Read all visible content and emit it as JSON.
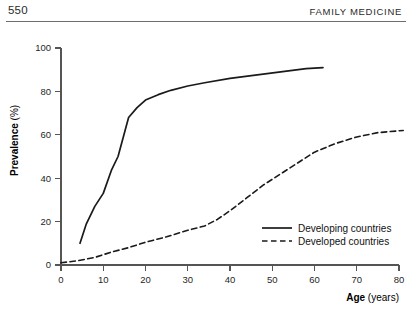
{
  "header": {
    "folio": "550",
    "journal": "FAMILY MEDICINE"
  },
  "chart_data": {
    "type": "line",
    "title": "",
    "xlabel_strong": "Age",
    "xlabel_unit": " (years)",
    "ylabel_strong": "Prevalence",
    "ylabel_unit": " (%)",
    "xlim": [
      0,
      80
    ],
    "ylim": [
      0,
      100
    ],
    "xticks": [
      0,
      10,
      20,
      30,
      40,
      50,
      60,
      70,
      80
    ],
    "xtick_labels": [
      "0",
      "10",
      "20",
      "30",
      "40",
      "50",
      "60",
      "70",
      "80"
    ],
    "yticks": [
      0,
      20,
      40,
      60,
      80,
      100
    ],
    "ytick_labels": [
      "0",
      "20",
      "40",
      "60",
      "80",
      "100"
    ],
    "grid": false,
    "legend_position": "inside-bottom-right",
    "series": [
      {
        "name": "Developing countries",
        "style": "solid",
        "color": "#1a1a1a",
        "x": [
          4.5,
          6,
          8,
          10,
          12,
          13.5,
          16,
          18,
          20,
          23,
          26,
          30,
          34,
          40,
          46,
          52,
          58,
          62
        ],
        "y": [
          10,
          19,
          27,
          33,
          44,
          50,
          68,
          72.5,
          76,
          78.5,
          80.5,
          82.5,
          84,
          86,
          87.5,
          89,
          90.5,
          91
        ]
      },
      {
        "name": "Developed countries",
        "style": "dashed",
        "color": "#1a1a1a",
        "x": [
          0,
          4,
          8,
          12,
          16,
          20,
          25,
          30,
          34,
          37,
          40,
          44,
          48,
          52,
          56,
          60,
          65,
          70,
          75,
          81
        ],
        "y": [
          1,
          2,
          3.5,
          6,
          8,
          10.5,
          13,
          16,
          18,
          21,
          25,
          31,
          37,
          42,
          47,
          52,
          56,
          59,
          61,
          62
        ]
      }
    ]
  }
}
